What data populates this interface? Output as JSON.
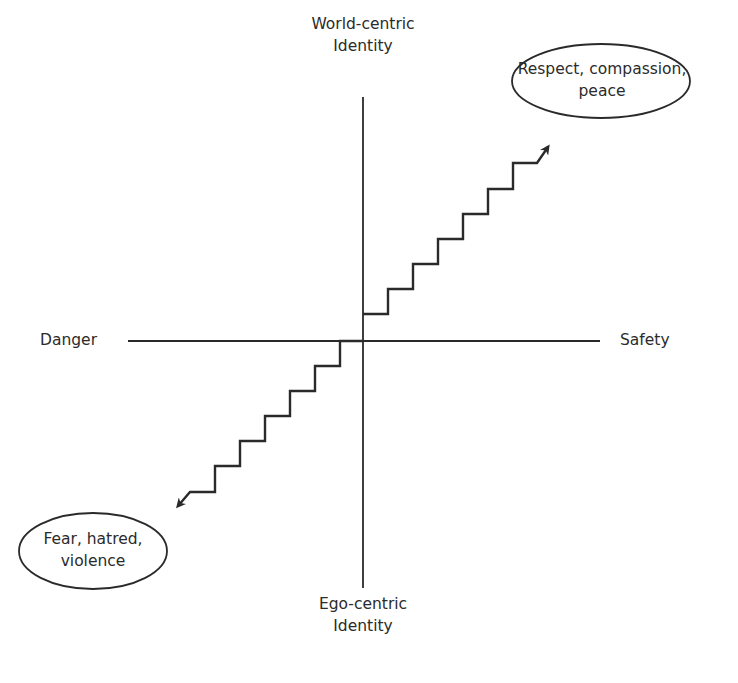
{
  "diagram": {
    "type": "quadrant-staircase",
    "axes": {
      "vertical": {
        "top_label_line1": "World-centric",
        "top_label_line2": "Identity",
        "bottom_label_line1": "Ego-centric",
        "bottom_label_line2": "Identity"
      },
      "horizontal": {
        "left_label": "Danger",
        "right_label": "Safety"
      }
    },
    "outcomes": {
      "positive": {
        "line1": "Respect, compassion,",
        "line2": "peace",
        "direction": "up-right"
      },
      "negative": {
        "line1": "Fear, hatred,",
        "line2": "violence",
        "direction": "down-left"
      }
    },
    "colors": {
      "line": "#2a2a2a",
      "text": "#2b2b2b",
      "background": "#ffffff"
    }
  }
}
